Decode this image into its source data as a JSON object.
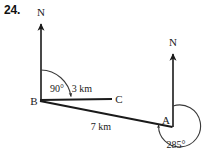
{
  "question": {
    "number": "24."
  },
  "diagram": {
    "type": "bearing-diagram",
    "stroke_color": "#1a1a1a",
    "arc_color": "#3a3a3a",
    "points": [
      {
        "label": "B",
        "x": 40,
        "y": 101
      },
      {
        "label": "C",
        "x": 112,
        "y": 99
      },
      {
        "label": "A",
        "x": 172,
        "y": 127
      }
    ],
    "north_arrows": [
      {
        "label": "N",
        "at_point": "B",
        "x": 41,
        "top_y": 22,
        "label_y": 14
      },
      {
        "label": "N",
        "at_point": "A",
        "x": 173,
        "top_y": 52,
        "label_y": 44
      }
    ],
    "segments": [
      {
        "from": "B",
        "to": "C",
        "length_label": "3 km"
      },
      {
        "from": "B",
        "to": "A",
        "length_label": "7 km"
      }
    ],
    "angles": [
      {
        "at_point": "B",
        "label": "90",
        "degree_symbol": "°",
        "value_text": "90°"
      },
      {
        "at_point": "A",
        "label": "285",
        "degree_symbol": "°",
        "value_text": "285°"
      }
    ],
    "labels": {
      "B": "B",
      "C": "C",
      "A": "A",
      "north_b": "N",
      "north_a": "N",
      "dist_bc": "3 km",
      "dist_ba": "7 km",
      "angle_b": "90°",
      "angle_a": "285°"
    }
  }
}
